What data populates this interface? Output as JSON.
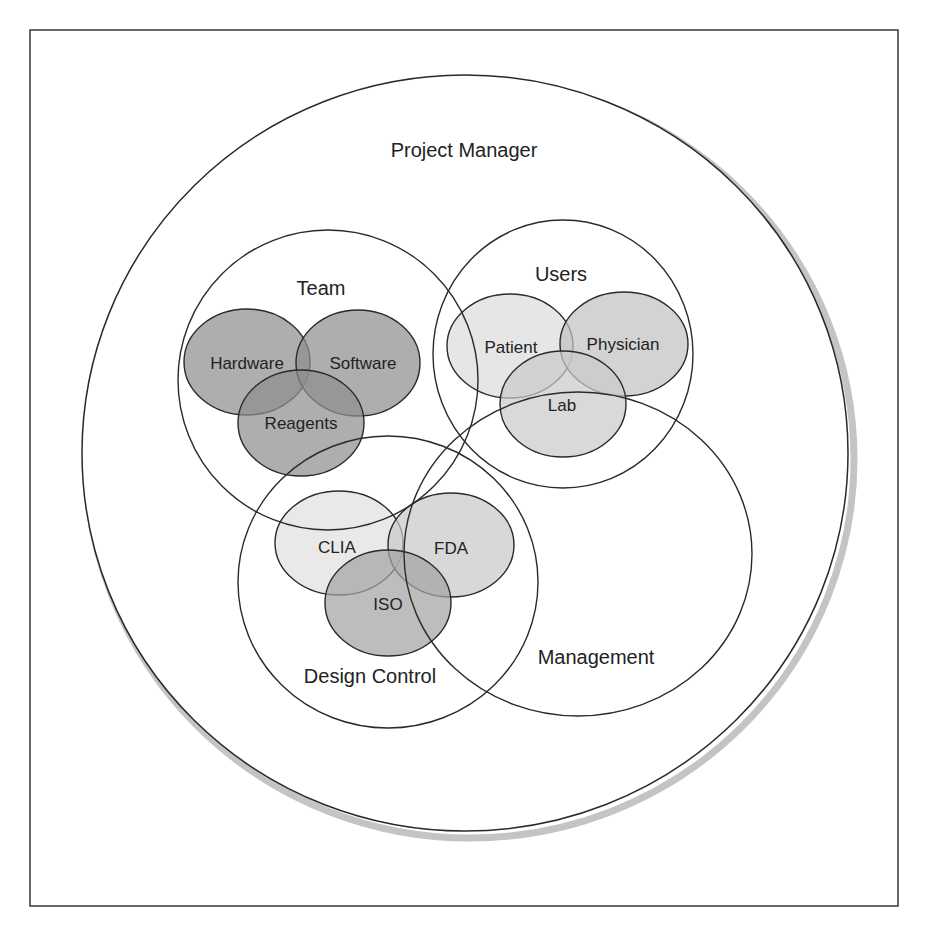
{
  "diagram": {
    "title": "Project Manager",
    "colors": {
      "outline": "#2a2a2a",
      "shadow": "#c4c4c4",
      "team_fill": "#8f8f8f",
      "users_patient": "#dcdcdc",
      "users_physician": "#c2c2c2",
      "users_lab": "#cbcbcb",
      "dc_clia": "#e0e0e0",
      "dc_fda": "#c9c9c9",
      "dc_iso": "#a3a3a3"
    },
    "outer": {
      "label": "Project Manager"
    },
    "groups": [
      {
        "id": "team",
        "label": "Team",
        "members": [
          {
            "label": "Hardware"
          },
          {
            "label": "Software"
          },
          {
            "label": "Reagents"
          }
        ]
      },
      {
        "id": "users",
        "label": "Users",
        "members": [
          {
            "label": "Patient"
          },
          {
            "label": "Physician"
          },
          {
            "label": "Lab"
          }
        ]
      },
      {
        "id": "design_control",
        "label": "Design Control",
        "members": [
          {
            "label": "CLIA"
          },
          {
            "label": "FDA"
          },
          {
            "label": "ISO"
          }
        ]
      },
      {
        "id": "management",
        "label": "Management",
        "members": []
      }
    ]
  }
}
